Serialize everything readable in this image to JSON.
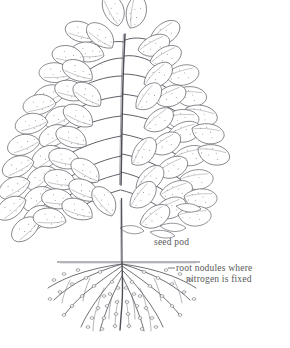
{
  "figure": {
    "background_color": "#ffffff",
    "ink_color": "#55555a",
    "leaf_stipple_color": "#6d6d72",
    "root_color": "#5a5a60",
    "label_color": "#4a4a4a"
  },
  "labels": {
    "seed_pod": "seed pod",
    "root_nodules_line1": "root nodules where",
    "root_nodules_line2": "nitrogen is fixed"
  },
  "ground_line": {
    "x_start": 57,
    "x_end": 200,
    "y": 262
  },
  "stem": {
    "x": 122,
    "y_top": 180,
    "y_bottom": 262
  }
}
